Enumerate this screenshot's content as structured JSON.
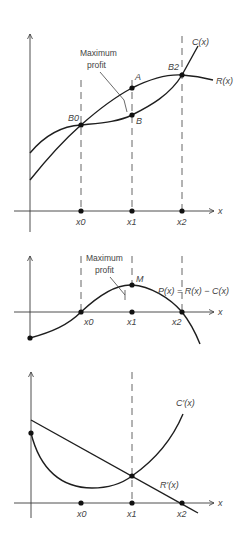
{
  "diagram": {
    "top_chart": {
      "curves": {
        "cost": "C(x)",
        "revenue": "R(x)"
      },
      "points": {
        "b0": "B0",
        "b2": "B2",
        "a": "A",
        "b": "B"
      },
      "annotation_line1": "Maximum",
      "annotation_line2": "profit",
      "x_axis_label": "x",
      "ticks": [
        "x0",
        "x1",
        "x2"
      ]
    },
    "middle_chart": {
      "curve_label": "P(x) = R(x) − C(x)",
      "point_m": "M",
      "annotation_line1": "Maximum",
      "annotation_line2": "profit",
      "x_axis_label": "x",
      "ticks": [
        "x0",
        "x1",
        "x2"
      ]
    },
    "bottom_chart": {
      "curves": {
        "marginal_cost": "C′(x)",
        "marginal_revenue": "R′(x)"
      },
      "x_axis_label": "x",
      "ticks": [
        "x0",
        "x1",
        "x2"
      ]
    }
  }
}
